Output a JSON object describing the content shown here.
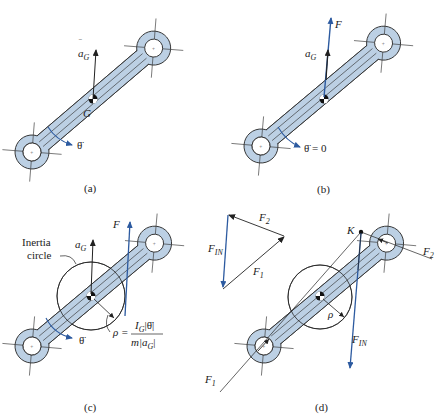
{
  "colors": {
    "link_fill": "#bcd0e4",
    "link_stroke": "#333333",
    "force_blue": "#2c5aa0",
    "line": "#222222",
    "background": "#ffffff"
  },
  "panels": [
    {
      "id": "a",
      "caption": "(a)",
      "labels": {
        "accel": "ā_G",
        "accel_main": "a",
        "accel_sub": "G",
        "center": "G",
        "angular": "θ̈"
      }
    },
    {
      "id": "b",
      "caption": "(b)",
      "labels": {
        "force": "F",
        "accel_main": "a",
        "accel_sub": "G",
        "angular": "θ̈ = 0"
      }
    },
    {
      "id": "c",
      "caption": "(c)",
      "labels": {
        "force": "F",
        "accel_main": "a",
        "accel_sub": "G",
        "inertia_circle_line1": "Inertia",
        "inertia_circle_line2": "circle",
        "angular": "θ̈",
        "rho": "ρ =",
        "formula_num_main": "I",
        "formula_num_sub": "G",
        "formula_num_rest": "|θ̈|",
        "formula_den_pre": "m|",
        "formula_den_main": "a",
        "formula_den_sub": "G",
        "formula_den_post": "|"
      }
    },
    {
      "id": "d",
      "caption": "(d)",
      "labels": {
        "triangle_fin_main": "F",
        "triangle_fin_sub": "IN",
        "triangle_f1_main": "F",
        "triangle_f1_sub": "1",
        "triangle_f2_main": "F",
        "triangle_f2_sub": "2",
        "point_k": "K",
        "rho": "ρ",
        "f2_main": "F",
        "f2_sub": "2",
        "f1_main": "F",
        "f1_sub": "1",
        "fin_main": "F",
        "fin_sub": "IN"
      }
    }
  ]
}
